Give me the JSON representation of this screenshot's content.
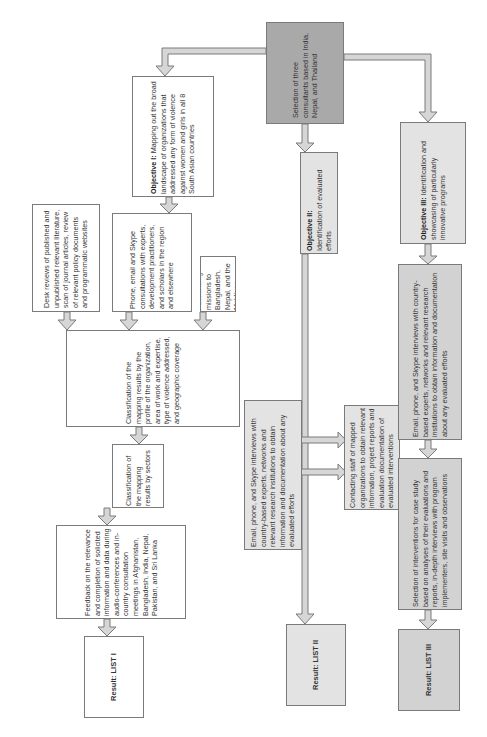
{
  "diagram": {
    "orientation": "rotated 90deg counter-clockwise (text reads bottom-to-top)",
    "start": {
      "text": "Selection of three consultants based in India, Nepal, and Thailand"
    },
    "objective1": {
      "title": "Objective I:",
      "text": "Mapping out the broad landscape of organizations that addressed any form of violence against women and girls in all 8 South Asian countries"
    },
    "objective2": {
      "title": "Objective II:",
      "text": "Identification of evaluated efforts"
    },
    "objective3": {
      "title": "Objective III:",
      "text": "Identification and showcasing of particularly innovative programs"
    },
    "branch1": {
      "methods": [
        "Desk reviews of published and unpublished relevant literature, scan of journal articles, review of relevant policy documents and programmatic websites",
        "Phone, email and Skype consultations with experts, development practitioners, and scholars in the region and elsewhere",
        "Fact-finding missions to Bangladesh, Nepal, and the Maldives"
      ],
      "classification1": "Classification of the mapping results by the profile of the organization, area of work and expertise, type of violence addressed, and geographic coverage",
      "classification2": "Classification of the mapping results by sectors",
      "feedback": "Feedback on the relevance and completion of solicited information and data during audio-conferences and in-country consultation meetings in Afghanistan, Bangladesh, India, Nepal, Pakistan, and Sri Lanka",
      "result": "Result: LIST I"
    },
    "branch2": {
      "contact_staff": "Contacting staff of mapped organizations to obtain relevant information, project reports and evaluation documentation of evaluated interventions",
      "interviews": "Email, phone, and Skype interviews with country-based experts, networks and relevant research institutions to obtain information and documentation about any evaluated efforts",
      "result": "Result: LIST II"
    },
    "branch3": {
      "interviews": "Email, phone, and Skype interviews with country-based experts, networks and relevant research institutions to obtain information and documentation about any evaluated efforts",
      "selection": "Selection of interventions for case study based on analyses of their evaluations and reports, in-depth interviews with program implementers, site visits and observations",
      "result": "Result: LIST III"
    }
  },
  "colors": {
    "start_fill": "#a9a9a9",
    "objective_fill": "#e3e3e3",
    "branch3_fill": "#d2d2d2",
    "white_fill": "#ffffff",
    "border": "#7a7a7a",
    "arrow_fill": "#d6d6d6"
  }
}
